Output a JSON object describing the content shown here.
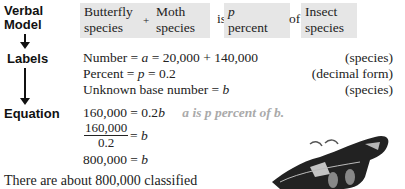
{
  "labels": {
    "verbal_model_line1": "Verbal",
    "verbal_model_line2": "Model",
    "labels": "Labels",
    "equation": "Equation"
  },
  "verbal_model": {
    "box1_line1": "Butterfly",
    "box1_line2": "species",
    "plus": "+",
    "box2_line1": "Moth",
    "box2_line2": "species",
    "is": "is",
    "box3_line1": "p",
    "box3_line2": "percent",
    "of": "of",
    "box4_line1": "Insect",
    "box4_line2": "species"
  },
  "label_rows": [
    {
      "left_text": "Number = ",
      "var": "a",
      "right_expr": " = 20,000 + 140,000",
      "unit": "(species)"
    },
    {
      "left_text": "Percent = ",
      "var": "p",
      "right_expr": " = 0.2",
      "unit": "(decimal form)"
    },
    {
      "left_text": "Unknown base number = ",
      "var": "b",
      "right_expr": "",
      "unit": "(species)"
    }
  ],
  "equation": {
    "line1_left": "160,000 = 0.2",
    "line1_var": "b",
    "note": "a is p percent of b.",
    "frac_num": "160,000",
    "frac_den": "0.2",
    "line2_rest": " = ",
    "line2_var": "b",
    "line3_left": "800,000 = ",
    "line3_var": "b"
  },
  "conclusion": "There are about 800,000 classified",
  "image": {
    "description": "moth-illustration"
  }
}
